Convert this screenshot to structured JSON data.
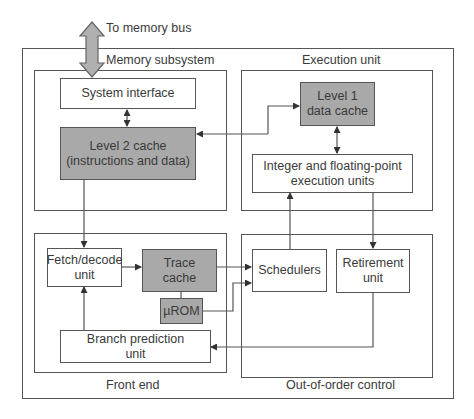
{
  "diagram": {
    "external": {
      "memory_bus_label": "To memory bus"
    },
    "regions": {
      "memory_subsystem": "Memory subsystem",
      "execution_unit": "Execution unit",
      "front_end": "Front end",
      "out_of_order_control": "Out-of-order control"
    },
    "blocks": {
      "system_interface": "System interface",
      "level2_cache_line1": "Level 2 cache",
      "level2_cache_line2": "(instructions and data)",
      "level1_cache_line1": "Level 1",
      "level1_cache_line2": "data cache",
      "integer_fp_line1": "Integer and floating-point",
      "integer_fp_line2": "execution units",
      "fetch_decode_line1": "Fetch/decode",
      "fetch_decode_line2": "unit",
      "trace_cache_line1": "Trace",
      "trace_cache_line2": "cache",
      "urom": "µROM",
      "branch_prediction_line1": "Branch prediction",
      "branch_prediction_line2": "unit",
      "schedulers": "Schedulers",
      "retirement_line1": "Retirement",
      "retirement_line2": "unit"
    },
    "colors": {
      "shaded_block": "#a9a9a9",
      "line": "#555555",
      "arrow_fill": "#b0b0b0"
    }
  }
}
